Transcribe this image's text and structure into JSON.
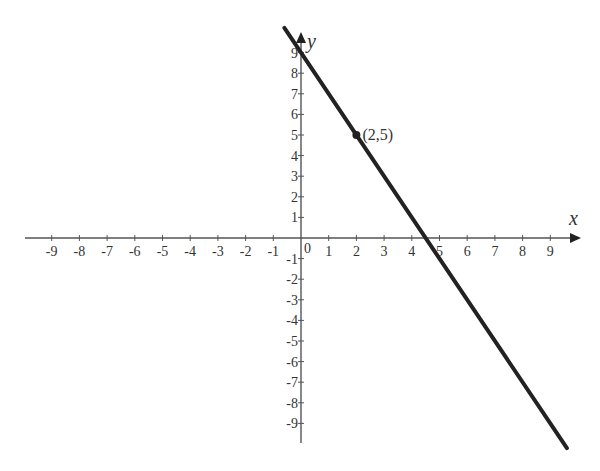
{
  "chart_data": {
    "type": "line",
    "title": "",
    "xlabel": "x",
    "ylabel": "y",
    "xlim": [
      -9,
      9
    ],
    "ylim": [
      -9,
      9
    ],
    "x_ticks": [
      -9,
      -8,
      -7,
      -6,
      -5,
      -4,
      -3,
      -2,
      -1,
      0,
      1,
      2,
      3,
      4,
      5,
      6,
      7,
      8,
      9
    ],
    "y_ticks": [
      -9,
      -8,
      -7,
      -6,
      -5,
      -4,
      -3,
      -2,
      -1,
      1,
      2,
      3,
      4,
      5,
      6,
      7,
      8,
      9
    ],
    "grid": false,
    "series": [
      {
        "name": "line",
        "equation": "y = -2x + 9",
        "slope": -2,
        "intercept": 9,
        "x": [
          -0.6,
          9.6
        ],
        "y": [
          10.2,
          -10.2
        ],
        "color": "#222222"
      }
    ],
    "annotations": [
      {
        "type": "point",
        "x": 2,
        "y": 5,
        "label": "(2,5)"
      }
    ]
  },
  "axes": {
    "x_label": "x",
    "y_label": "y",
    "origin_label": "0"
  },
  "point_label": "(2,5)"
}
